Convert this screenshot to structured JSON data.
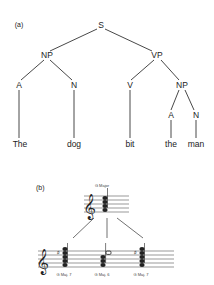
{
  "panel_a": {
    "label": "(a)",
    "nodes": {
      "S": "S",
      "NP1": "NP",
      "VP": "VP",
      "A1": "A",
      "N1": "N",
      "V": "V",
      "NP2": "NP",
      "A2": "A",
      "N2": "N"
    },
    "words": [
      "The",
      "dog",
      "bit",
      "the",
      "man"
    ]
  },
  "panel_b": {
    "label": "(b)",
    "top_chord": "G Major",
    "bottom_chords": [
      "G Maj. 7",
      "G Maj. 6",
      "G Maj. 7"
    ]
  }
}
